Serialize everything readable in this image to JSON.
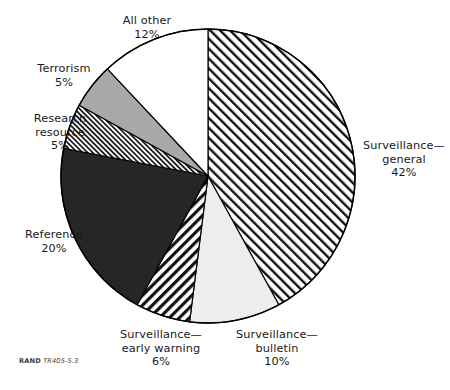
{
  "figure": {
    "source_org": "RAND",
    "source_id": "TR405-5.3"
  },
  "chart_data": {
    "type": "pie",
    "title": "",
    "subtitle": "",
    "xlabel": "",
    "ylabel": "",
    "units": "percent",
    "start_angle_deg": 0,
    "direction": "clockwise",
    "legend_position": "outside-labels",
    "grid": false,
    "total": 100,
    "categories": [
      "Surveillance—general",
      "Surveillance—bulletin",
      "Surveillance—early warning",
      "Reference",
      "Research resource",
      "Terrorism",
      "All other"
    ],
    "values": [
      42,
      10,
      6,
      20,
      5,
      5,
      12
    ],
    "slices": [
      {
        "key": "surveillance-general",
        "label": "Surveillance—",
        "label_line2": "general",
        "value": 42,
        "value_text": "42%",
        "fill": "#ffffff",
        "pattern": "diagonal-hatch-right",
        "pattern_color": "#111111",
        "stroke": "#000000"
      },
      {
        "key": "surveillance-bulletin",
        "label": "Surveillance—",
        "label_line2": "bulletin",
        "value": 10,
        "value_text": "10%",
        "fill": "#ededed",
        "pattern": "solid",
        "pattern_color": "#ededed",
        "stroke": "#000000"
      },
      {
        "key": "surveillance-early-warning",
        "label": "Surveillance—",
        "label_line2": "early warning",
        "value": 6,
        "value_text": "6%",
        "fill": "#ffffff",
        "pattern": "diagonal-hatch-left-bold",
        "pattern_color": "#111111",
        "stroke": "#000000"
      },
      {
        "key": "reference",
        "label": "Reference",
        "label_line2": "",
        "value": 20,
        "value_text": "20%",
        "fill": "#262626",
        "pattern": "solid",
        "pattern_color": "#262626",
        "stroke": "#000000"
      },
      {
        "key": "research-resource",
        "label": "Research",
        "label_line2": "resource",
        "value": 5,
        "value_text": "5%",
        "fill": "#ffffff",
        "pattern": "diagonal-hatch-fine",
        "pattern_color": "#111111",
        "stroke": "#000000"
      },
      {
        "key": "terrorism",
        "label": "Terrorism",
        "label_line2": "",
        "value": 5,
        "value_text": "5%",
        "fill": "#a9a9a9",
        "pattern": "solid",
        "pattern_color": "#a9a9a9",
        "stroke": "#000000"
      },
      {
        "key": "all-other",
        "label": "All other",
        "label_line2": "",
        "value": 12,
        "value_text": "12%",
        "fill": "#ffffff",
        "pattern": "solid",
        "pattern_color": "#ffffff",
        "stroke": "#000000"
      }
    ]
  },
  "labels": {
    "all_other": {
      "name": "All other",
      "value": "12%"
    },
    "terrorism": {
      "name": "Terrorism",
      "value": "5%"
    },
    "research_resource": {
      "name_line1": "Research",
      "name_line2": "resource",
      "value": "5%"
    },
    "reference": {
      "name": "Reference",
      "value": "20%"
    },
    "early_warning": {
      "name_line1": "Surveillance—",
      "name_line2": "early warning",
      "value": "6%"
    },
    "bulletin": {
      "name_line1": "Surveillance—",
      "name_line2": "bulletin",
      "value": "10%"
    },
    "general": {
      "name_line1": "Surveillance—",
      "name_line2": "general",
      "value": "42%"
    }
  }
}
